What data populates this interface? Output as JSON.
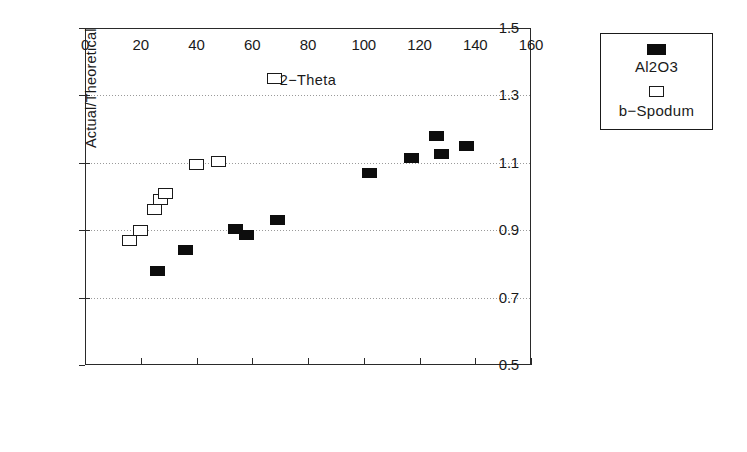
{
  "chart_data": {
    "type": "scatter",
    "title": "",
    "xlabel": "2−Theta",
    "ylabel": "Actual/Theoretical",
    "xlim": [
      0,
      160
    ],
    "ylim": [
      0.5,
      1.5
    ],
    "xticks": [
      0,
      20,
      40,
      60,
      80,
      100,
      120,
      140,
      160
    ],
    "yticks": [
      0.5,
      0.7,
      0.9,
      1.1,
      1.3,
      1.5
    ],
    "xtick_labels": [
      "0",
      "20",
      "40",
      "60",
      "80",
      "100",
      "120",
      "140",
      "160"
    ],
    "ytick_labels": [
      "0.5",
      "0.7",
      "0.9",
      "1.1",
      "1.3",
      "1.5"
    ],
    "grid": "horizontal-dotted",
    "legend_position": "outside-right-top",
    "series": [
      {
        "name": "Al2O3",
        "marker": "filled-square",
        "color": "#0d0d0d",
        "points": [
          {
            "x": 26,
            "y": 0.78
          },
          {
            "x": 36,
            "y": 0.84
          },
          {
            "x": 54,
            "y": 0.905
          },
          {
            "x": 58,
            "y": 0.885
          },
          {
            "x": 69,
            "y": 0.93
          },
          {
            "x": 102,
            "y": 1.07
          },
          {
            "x": 117,
            "y": 1.115
          },
          {
            "x": 126,
            "y": 1.18
          },
          {
            "x": 128,
            "y": 1.125
          },
          {
            "x": 137,
            "y": 1.15
          }
        ]
      },
      {
        "name": "b−Spodum",
        "marker": "open-square",
        "color": "#1a1a1a",
        "points": [
          {
            "x": 16,
            "y": 0.87
          },
          {
            "x": 20,
            "y": 0.9
          },
          {
            "x": 25,
            "y": 0.96
          },
          {
            "x": 27,
            "y": 0.99
          },
          {
            "x": 29,
            "y": 1.01
          },
          {
            "x": 40,
            "y": 1.095
          },
          {
            "x": 48,
            "y": 1.105
          },
          {
            "x": 68,
            "y": 1.35
          }
        ]
      }
    ]
  },
  "legend": {
    "entries": [
      {
        "label": "Al2O3",
        "marker": "filled-square"
      },
      {
        "label": "b−Spodum",
        "marker": "open-square"
      }
    ]
  }
}
